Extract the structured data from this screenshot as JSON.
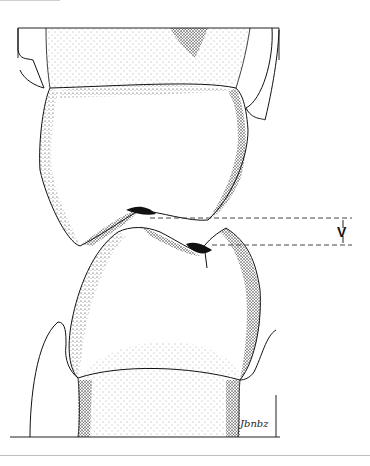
{
  "figure": {
    "type": "dental illustration",
    "measurement_label": "V",
    "signature": "Jbnbz",
    "colors": {
      "ink": "#111111",
      "stipple": "#333333",
      "background": "#ffffff",
      "dashed_line": "#444444"
    }
  }
}
